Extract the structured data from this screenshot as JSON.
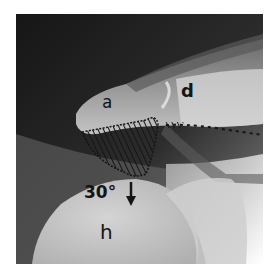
{
  "figure": {
    "type": "radiograph",
    "labels": {
      "acromion": "a",
      "clavicle": "d",
      "humeral_head": "h",
      "angle": "30°"
    },
    "annotations": {
      "hatched_region": "subacromial space (hatched triangle)",
      "dotted_line": "reference line extending to right edge",
      "arrow_direction": "down"
    },
    "colors": {
      "background": "#ffffff",
      "xray_dark": "#1a1a1a",
      "bone_light": "#c8c8c8",
      "annotation_ink": "#151515"
    }
  }
}
